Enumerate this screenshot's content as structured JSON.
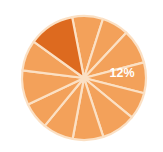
{
  "chart_data": {
    "type": "pie",
    "title": "",
    "subtitle": "",
    "xlabel": "",
    "ylabel": "",
    "legend": [],
    "legend_position": "none",
    "grid": false,
    "center": {
      "cx": 84,
      "cy": 78
    },
    "radius": 62,
    "start_angle_deg": -101,
    "separator_color": "#fbe0c4",
    "colors": {
      "base": "#f3a15a",
      "highlight": "#dd6a1f",
      "background": "#ffffff",
      "label_text": "#ffffff"
    },
    "categories": [
      "Slice 1",
      "Slice 2",
      "Slice 3",
      "Slice 4",
      "Slice 5",
      "Slice 6",
      "Slice 7",
      "Slice 8",
      "Slice 9",
      "Slice 10",
      "Slice 11",
      "Slice 12"
    ],
    "values": [
      8,
      7,
      9,
      8,
      7,
      9,
      8,
      8,
      7,
      9,
      8,
      12
    ],
    "slices": [
      {
        "label": "Slice 1",
        "value": 8,
        "percent": "",
        "highlighted": false,
        "color": "#f3a15a"
      },
      {
        "label": "Slice 2",
        "value": 7,
        "percent": "",
        "highlighted": false,
        "color": "#f3a15a"
      },
      {
        "label": "Slice 3",
        "value": 9,
        "percent": "",
        "highlighted": false,
        "color": "#f3a15a"
      },
      {
        "label": "Slice 4",
        "value": 8,
        "percent": "",
        "highlighted": false,
        "color": "#f3a15a"
      },
      {
        "label": "Slice 5",
        "value": 7,
        "percent": "",
        "highlighted": false,
        "color": "#f3a15a"
      },
      {
        "label": "Slice 6",
        "value": 9,
        "percent": "",
        "highlighted": false,
        "color": "#f3a15a"
      },
      {
        "label": "Slice 7",
        "value": 8,
        "percent": "",
        "highlighted": false,
        "color": "#f3a15a"
      },
      {
        "label": "Slice 8",
        "value": 8,
        "percent": "",
        "highlighted": false,
        "color": "#f3a15a"
      },
      {
        "label": "Slice 9",
        "value": 7,
        "percent": "",
        "highlighted": false,
        "color": "#f3a15a"
      },
      {
        "label": "Slice 10",
        "value": 9,
        "percent": "",
        "highlighted": false,
        "color": "#f3a15a"
      },
      {
        "label": "Slice 11",
        "value": 8,
        "percent": "",
        "highlighted": false,
        "color": "#f3a15a"
      },
      {
        "label": "Slice 12",
        "value": 12,
        "percent": "12%",
        "highlighted": true,
        "color": "#dd6a1f"
      }
    ],
    "data_labels": [
      {
        "text": "12%",
        "slice_index": 11,
        "x": 122,
        "y": 74
      }
    ]
  }
}
